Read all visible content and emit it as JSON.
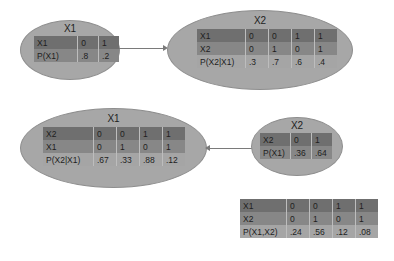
{
  "diagram": {
    "top_network": {
      "nodes": [
        {
          "title": "X1",
          "table": {
            "rows": [
              {
                "label": "X1",
                "values": [
                  "0",
                  "1"
                ]
              },
              {
                "label": "P(X1)",
                "values": [
                  ".8",
                  ".2"
                ]
              }
            ]
          }
        },
        {
          "title": "X2",
          "table": {
            "rows": [
              {
                "label": "X1",
                "values": [
                  "0",
                  "0",
                  "1",
                  "1"
                ]
              },
              {
                "label": "X2",
                "values": [
                  "0",
                  "1",
                  "0",
                  "1"
                ]
              },
              {
                "label": "P(X2|X1)",
                "values": [
                  ".3",
                  ".7",
                  ".6",
                  ".4"
                ]
              }
            ]
          }
        }
      ],
      "edge": {
        "from": "X1",
        "to": "X2"
      }
    },
    "bottom_network": {
      "nodes": [
        {
          "title": "X1",
          "table": {
            "rows": [
              {
                "label": "X2",
                "values": [
                  "0",
                  "0",
                  "1",
                  "1"
                ]
              },
              {
                "label": "X1",
                "values": [
                  "0",
                  "1",
                  "0",
                  "1"
                ]
              },
              {
                "label": "P(X2|X1)",
                "values": [
                  ".67",
                  ".33",
                  ".88",
                  ".12"
                ]
              }
            ]
          }
        },
        {
          "title": "X2",
          "table": {
            "rows": [
              {
                "label": "X2",
                "values": [
                  "0",
                  "1"
                ]
              },
              {
                "label": "P(X1)",
                "values": [
                  ".36",
                  ".64"
                ]
              }
            ]
          }
        }
      ],
      "edge": {
        "from": "X2",
        "to": "X1"
      }
    },
    "joint_table": {
      "rows": [
        {
          "label": "X1",
          "values": [
            "0",
            "0",
            "1",
            "1"
          ]
        },
        {
          "label": "X2",
          "values": [
            "0",
            "1",
            "0",
            "1"
          ]
        },
        {
          "label": "P(X1,X2)",
          "values": [
            ".24",
            ".56",
            ".12",
            ".08"
          ]
        }
      ]
    },
    "colors": {
      "node_fill": "#a7a7a7",
      "row_dark": "#6f6f6f",
      "row_mid": "#878787",
      "row_light": "#a5a5a5",
      "edge": "#7a7a7a"
    }
  }
}
